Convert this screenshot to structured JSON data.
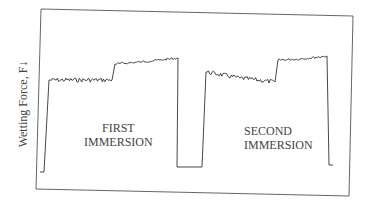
{
  "chart_data": {
    "type": "line",
    "title": "",
    "xlabel": "",
    "ylabel": "Wetting Force, F↓",
    "grid": false,
    "legend": null,
    "annotations": [
      {
        "text_lines": [
          "FIRST",
          "IMMERSION"
        ],
        "position": "lower-left-center"
      },
      {
        "text_lines": [
          "SECOND",
          "IMMERSION"
        ],
        "position": "lower-right-center"
      }
    ],
    "series": [
      {
        "name": "Wetting force",
        "points_px": [
          [
            40,
            172
          ],
          [
            44,
            172
          ],
          [
            49,
            80
          ],
          [
            112,
            80
          ],
          [
            115,
            64
          ],
          [
            140,
            62
          ],
          [
            160,
            60
          ],
          [
            178,
            58
          ],
          [
            177,
            167
          ],
          [
            202,
            167
          ],
          [
            206,
            72
          ],
          [
            240,
            78
          ],
          [
            275,
            82
          ],
          [
            278,
            60
          ],
          [
            300,
            59
          ],
          [
            327,
            56
          ],
          [
            329,
            165
          ],
          [
            333,
            165
          ]
        ],
        "relative_levels": {
          "baseline": 0.0,
          "first_plateau_low": 0.8,
          "first_plateau_high": 0.95,
          "second_plateau_low": 0.85,
          "second_plateau_high": 0.97
        }
      }
    ],
    "frame_px": {
      "tl": [
        41,
        9
      ],
      "tr": [
        353,
        16
      ],
      "br": [
        349,
        196
      ],
      "bl": [
        36,
        189
      ]
    }
  },
  "labels": {
    "ylabel": "Wetting Force, F↓",
    "first": [
      "FIRST",
      "IMMERSION"
    ],
    "second": [
      "SECOND",
      "IMMERSION"
    ]
  }
}
